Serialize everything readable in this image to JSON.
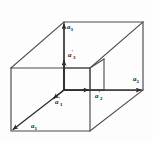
{
  "figure": {
    "background_color": "#fdfdfd",
    "line_color": "#4a4a4a",
    "arrow_color": "#333333",
    "label_color": "#1a1a1a"
  },
  "labels": {
    "a3": {
      "base": "a",
      "sub": "3",
      "prime": "",
      "x": 67,
      "y": 24
    },
    "a3p": {
      "base": "a",
      "sub": "3",
      "prime": "'",
      "x": 68,
      "y": 52
    },
    "a2": {
      "base": "a",
      "sub": "2",
      "prime": "",
      "x": 133,
      "y": 76
    },
    "a2p": {
      "base": "a",
      "sub": "2",
      "prime": "'",
      "x": 95,
      "y": 93
    },
    "a1p": {
      "base": "a",
      "sub": "1",
      "prime": "'",
      "x": 55,
      "y": 99
    },
    "a1": {
      "base": "a",
      "sub": "1",
      "prime": "",
      "x": 31,
      "y": 123
    }
  },
  "geometry": {
    "outer_cell": {
      "front_bottom_left": [
        11,
        131
      ],
      "front_bottom_right": [
        90,
        131
      ],
      "front_top_left": [
        11,
        68
      ],
      "front_top_right": [
        90,
        68
      ],
      "back_bottom_left": [
        64,
        90
      ],
      "back_bottom_right": [
        143,
        90
      ],
      "back_top_left": [
        64,
        22
      ],
      "back_top_right": [
        143,
        22
      ]
    },
    "inner_cell": {
      "front_bottom_left": [
        64,
        104
      ],
      "front_bottom_right": [
        90,
        104
      ],
      "front_top_left": [
        64,
        68
      ],
      "front_top_right": [
        90,
        68
      ],
      "back_top_left": [
        78,
        59
      ],
      "back_top_right": [
        104,
        59
      ],
      "back_bottom_right": [
        104,
        90
      ]
    }
  },
  "vectors": [
    {
      "name": "a1",
      "from": [
        11,
        131
      ],
      "to": [
        64,
        90
      ],
      "description": "lower-left diagonal basis vector"
    },
    {
      "name": "a2",
      "from": [
        64,
        90
      ],
      "to": [
        143,
        90
      ],
      "description": "horizontal basis vector to right"
    },
    {
      "name": "a3",
      "from": [
        64,
        90
      ],
      "to": [
        64,
        22
      ],
      "description": "vertical basis vector upward"
    },
    {
      "name": "a1p",
      "from": [
        64,
        90
      ],
      "to": [
        78,
        79
      ],
      "description": "short diagonal primed vector"
    },
    {
      "name": "a2p",
      "from": [
        64,
        90
      ],
      "to": [
        90,
        90
      ],
      "description": "short horizontal primed vector"
    },
    {
      "name": "a3p",
      "from": [
        64,
        90
      ],
      "to": [
        64,
        59
      ],
      "description": "short vertical primed vector"
    }
  ]
}
